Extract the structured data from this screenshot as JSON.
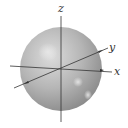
{
  "diagram": {
    "type": "3d-sphere-with-axes",
    "axes": {
      "x": {
        "label": "x"
      },
      "y": {
        "label": "y"
      },
      "z": {
        "label": "z"
      }
    },
    "colors": {
      "sphere_light": "#e4e4e4",
      "sphere_mid": "#b8b8b8",
      "sphere_dark": "#8e8e8e",
      "axis": "#333333",
      "background": "#ffffff"
    }
  }
}
